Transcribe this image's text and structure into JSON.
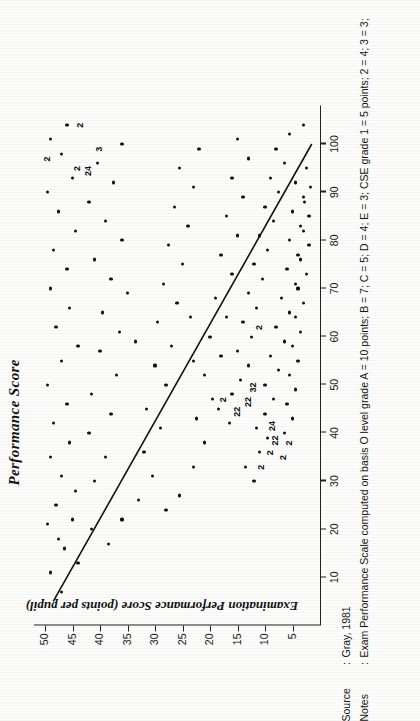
{
  "figure": {
    "title": "Performance Score",
    "ylabel": "Examination Performance Score (points per pupil)",
    "xlabel": ""
  },
  "caption": {
    "source_key": "Source",
    "source_colon": ":",
    "source_value": "Gray, 1981",
    "notes_key": "Notes",
    "notes_colon": ":",
    "notes_value": "Exam Performance Scale computed on basis O level grade A = 10 points; B = 7; C = 5; D = 4; E = 3; CSE grade 1 = 5 points; 2 = 4; 3 = 3;"
  },
  "chart_data": {
    "type": "scatter",
    "title": "Performance Score",
    "xlabel": "",
    "ylabel": "Examination Performance Score (points per pupil)",
    "xlim": [
      0,
      108
    ],
    "ylim": [
      0,
      52
    ],
    "xticks": [
      10,
      20,
      30,
      40,
      50,
      60,
      70,
      80,
      90,
      100
    ],
    "yticks": [
      5,
      10,
      15,
      20,
      25,
      30,
      35,
      40,
      45,
      50
    ],
    "grid": false,
    "legend": null,
    "trendline": {
      "x": [
        5,
        100
      ],
      "y": [
        48.5,
        1.5
      ],
      "style": "solid",
      "note": "downward linear fit"
    },
    "point_labels": [
      {
        "x": 97,
        "y": 49.5,
        "text": "2"
      },
      {
        "x": 95,
        "y": 44.0,
        "text": "2"
      },
      {
        "x": 94,
        "y": 42.0,
        "text": "24"
      },
      {
        "x": 99,
        "y": 40.0,
        "text": "3"
      },
      {
        "x": 104,
        "y": 43.5,
        "text": "2"
      },
      {
        "x": 47,
        "y": 17.5,
        "text": "2"
      },
      {
        "x": 44,
        "y": 15.0,
        "text": "22"
      },
      {
        "x": 46,
        "y": 13.0,
        "text": "22"
      },
      {
        "x": 49,
        "y": 12.0,
        "text": "32"
      },
      {
        "x": 33,
        "y": 10.5,
        "text": "2"
      },
      {
        "x": 36,
        "y": 9.0,
        "text": "2"
      },
      {
        "x": 38,
        "y": 8.0,
        "text": "22"
      },
      {
        "x": 41,
        "y": 8.5,
        "text": "24"
      },
      {
        "x": 35,
        "y": 6.5,
        "text": "2"
      },
      {
        "x": 38,
        "y": 5.5,
        "text": "2"
      },
      {
        "x": 62,
        "y": 11.0,
        "text": "2"
      }
    ],
    "points": [
      {
        "x": 7,
        "y": 47.0
      },
      {
        "x": 11,
        "y": 49.0
      },
      {
        "x": 16,
        "y": 46.5
      },
      {
        "x": 13,
        "y": 44.0
      },
      {
        "x": 18,
        "y": 47.5
      },
      {
        "x": 22,
        "y": 45.0
      },
      {
        "x": 21,
        "y": 49.5
      },
      {
        "x": 25,
        "y": 48.0
      },
      {
        "x": 28,
        "y": 44.5
      },
      {
        "x": 31,
        "y": 47.0
      },
      {
        "x": 35,
        "y": 49.0
      },
      {
        "x": 38,
        "y": 45.5
      },
      {
        "x": 42,
        "y": 48.5
      },
      {
        "x": 46,
        "y": 46.0
      },
      {
        "x": 50,
        "y": 49.5
      },
      {
        "x": 55,
        "y": 47.0
      },
      {
        "x": 58,
        "y": 44.0
      },
      {
        "x": 62,
        "y": 48.0
      },
      {
        "x": 66,
        "y": 45.5
      },
      {
        "x": 70,
        "y": 49.0
      },
      {
        "x": 74,
        "y": 46.0
      },
      {
        "x": 78,
        "y": 48.5
      },
      {
        "x": 82,
        "y": 44.5
      },
      {
        "x": 86,
        "y": 47.5
      },
      {
        "x": 90,
        "y": 49.5
      },
      {
        "x": 93,
        "y": 45.0
      },
      {
        "x": 98,
        "y": 47.0
      },
      {
        "x": 101,
        "y": 49.0
      },
      {
        "x": 104,
        "y": 46.0
      },
      {
        "x": 30,
        "y": 41.0
      },
      {
        "x": 35,
        "y": 39.0
      },
      {
        "x": 40,
        "y": 42.0
      },
      {
        "x": 44,
        "y": 38.0
      },
      {
        "x": 48,
        "y": 41.5
      },
      {
        "x": 52,
        "y": 37.0
      },
      {
        "x": 57,
        "y": 40.0
      },
      {
        "x": 61,
        "y": 36.5
      },
      {
        "x": 65,
        "y": 39.5
      },
      {
        "x": 69,
        "y": 35.0
      },
      {
        "x": 72,
        "y": 38.0
      },
      {
        "x": 76,
        "y": 41.0
      },
      {
        "x": 80,
        "y": 36.0
      },
      {
        "x": 84,
        "y": 39.0
      },
      {
        "x": 88,
        "y": 42.0
      },
      {
        "x": 92,
        "y": 37.5
      },
      {
        "x": 96,
        "y": 40.5
      },
      {
        "x": 100,
        "y": 36.0
      },
      {
        "x": 26,
        "y": 33.0
      },
      {
        "x": 31,
        "y": 30.5
      },
      {
        "x": 36,
        "y": 32.0
      },
      {
        "x": 41,
        "y": 29.0
      },
      {
        "x": 45,
        "y": 31.5
      },
      {
        "x": 50,
        "y": 28.0
      },
      {
        "x": 54,
        "y": 30.0
      },
      {
        "x": 58,
        "y": 27.0
      },
      {
        "x": 63,
        "y": 29.5
      },
      {
        "x": 67,
        "y": 26.0
      },
      {
        "x": 71,
        "y": 28.5
      },
      {
        "x": 75,
        "y": 25.0
      },
      {
        "x": 79,
        "y": 27.5
      },
      {
        "x": 83,
        "y": 24.0
      },
      {
        "x": 87,
        "y": 26.5
      },
      {
        "x": 91,
        "y": 23.0
      },
      {
        "x": 95,
        "y": 25.5
      },
      {
        "x": 99,
        "y": 22.0
      },
      {
        "x": 22,
        "y": 36.0
      },
      {
        "x": 27,
        "y": 25.5
      },
      {
        "x": 33,
        "y": 23.0
      },
      {
        "x": 38,
        "y": 21.0
      },
      {
        "x": 43,
        "y": 22.5
      },
      {
        "x": 47,
        "y": 19.5
      },
      {
        "x": 52,
        "y": 21.0
      },
      {
        "x": 56,
        "y": 18.0
      },
      {
        "x": 60,
        "y": 20.0
      },
      {
        "x": 64,
        "y": 17.0
      },
      {
        "x": 68,
        "y": 19.0
      },
      {
        "x": 73,
        "y": 16.0
      },
      {
        "x": 77,
        "y": 18.0
      },
      {
        "x": 81,
        "y": 15.0
      },
      {
        "x": 85,
        "y": 17.0
      },
      {
        "x": 89,
        "y": 14.0
      },
      {
        "x": 93,
        "y": 16.0
      },
      {
        "x": 97,
        "y": 13.0
      },
      {
        "x": 101,
        "y": 15.0
      },
      {
        "x": 42,
        "y": 16.5
      },
      {
        "x": 45,
        "y": 18.5
      },
      {
        "x": 48,
        "y": 16.0
      },
      {
        "x": 51,
        "y": 14.5
      },
      {
        "x": 54,
        "y": 13.0
      },
      {
        "x": 57,
        "y": 15.0
      },
      {
        "x": 60,
        "y": 12.5
      },
      {
        "x": 63,
        "y": 14.0
      },
      {
        "x": 66,
        "y": 11.5
      },
      {
        "x": 69,
        "y": 13.0
      },
      {
        "x": 72,
        "y": 10.5
      },
      {
        "x": 75,
        "y": 12.0
      },
      {
        "x": 78,
        "y": 9.5
      },
      {
        "x": 81,
        "y": 11.0
      },
      {
        "x": 84,
        "y": 8.5
      },
      {
        "x": 87,
        "y": 10.0
      },
      {
        "x": 90,
        "y": 7.5
      },
      {
        "x": 93,
        "y": 9.0
      },
      {
        "x": 96,
        "y": 6.5
      },
      {
        "x": 99,
        "y": 8.0
      },
      {
        "x": 102,
        "y": 5.5
      },
      {
        "x": 30,
        "y": 12.0
      },
      {
        "x": 33,
        "y": 13.5
      },
      {
        "x": 36,
        "y": 11.0
      },
      {
        "x": 39,
        "y": 9.5
      },
      {
        "x": 41,
        "y": 11.5
      },
      {
        "x": 44,
        "y": 10.0
      },
      {
        "x": 47,
        "y": 8.5
      },
      {
        "x": 50,
        "y": 10.0
      },
      {
        "x": 53,
        "y": 7.5
      },
      {
        "x": 56,
        "y": 9.0
      },
      {
        "x": 59,
        "y": 6.5
      },
      {
        "x": 62,
        "y": 8.0
      },
      {
        "x": 65,
        "y": 5.5
      },
      {
        "x": 68,
        "y": 7.0
      },
      {
        "x": 71,
        "y": 4.5
      },
      {
        "x": 74,
        "y": 6.0
      },
      {
        "x": 77,
        "y": 4.0
      },
      {
        "x": 80,
        "y": 5.5
      },
      {
        "x": 83,
        "y": 3.5
      },
      {
        "x": 86,
        "y": 5.0
      },
      {
        "x": 89,
        "y": 3.0
      },
      {
        "x": 92,
        "y": 4.5
      },
      {
        "x": 95,
        "y": 2.5
      },
      {
        "x": 104,
        "y": 3.0
      },
      {
        "x": 40,
        "y": 6.5
      },
      {
        "x": 43,
        "y": 5.0
      },
      {
        "x": 46,
        "y": 6.0
      },
      {
        "x": 49,
        "y": 4.5
      },
      {
        "x": 52,
        "y": 5.5
      },
      {
        "x": 55,
        "y": 4.0
      },
      {
        "x": 58,
        "y": 5.0
      },
      {
        "x": 61,
        "y": 3.5
      },
      {
        "x": 64,
        "y": 4.5
      },
      {
        "x": 67,
        "y": 3.0
      },
      {
        "x": 70,
        "y": 4.0
      },
      {
        "x": 73,
        "y": 2.5
      },
      {
        "x": 76,
        "y": 3.5
      },
      {
        "x": 79,
        "y": 2.0
      },
      {
        "x": 82,
        "y": 3.0
      },
      {
        "x": 85,
        "y": 2.0
      },
      {
        "x": 88,
        "y": 2.8
      },
      {
        "x": 91,
        "y": 1.8
      },
      {
        "x": 55,
        "y": 23.0
      },
      {
        "x": 59,
        "y": 33.5
      },
      {
        "x": 64,
        "y": 23.5
      },
      {
        "x": 20,
        "y": 41.5
      },
      {
        "x": 24,
        "y": 28.0
      },
      {
        "x": 17,
        "y": 38.5
      }
    ]
  }
}
